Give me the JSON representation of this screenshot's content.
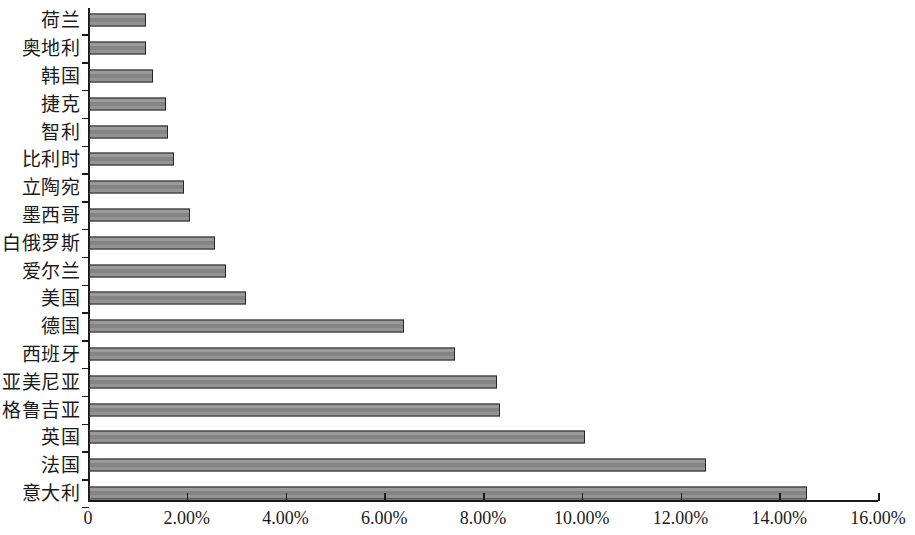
{
  "chart_data": {
    "type": "bar",
    "orientation": "horizontal",
    "title": "",
    "subtitle": "",
    "xlabel": "",
    "ylabel": "",
    "xlim": [
      0,
      16
    ],
    "grid": false,
    "legend": null,
    "value_unit": "%",
    "xtick_labels": [
      "0",
      "2.00%",
      "4.00%",
      "6.00%",
      "8.00%",
      "10.00%",
      "12.00%",
      "14.00%",
      "16.00%"
    ],
    "xtick_values": [
      0,
      2,
      4,
      6,
      8,
      10,
      12,
      14,
      16
    ],
    "categories": [
      "荷兰",
      "奥地利",
      "韩国",
      "捷克",
      "智利",
      "比利时",
      "立陶宛",
      "墨西哥",
      "白俄罗斯",
      "爱尔兰",
      "美国",
      "德国",
      "西班牙",
      "亚美尼亚",
      "格鲁吉亚",
      "英国",
      "法国",
      "意大利"
    ],
    "values": [
      1.15,
      1.15,
      1.3,
      1.55,
      1.6,
      1.72,
      1.92,
      2.05,
      2.55,
      2.78,
      3.18,
      6.38,
      7.42,
      8.27,
      8.32,
      10.05,
      12.5,
      14.55
    ],
    "bar_fill_color": "#8d8d8d",
    "bar_border_color": "#262626",
    "axis_color": "#1a1a1a",
    "background_color": "#ffffff"
  }
}
